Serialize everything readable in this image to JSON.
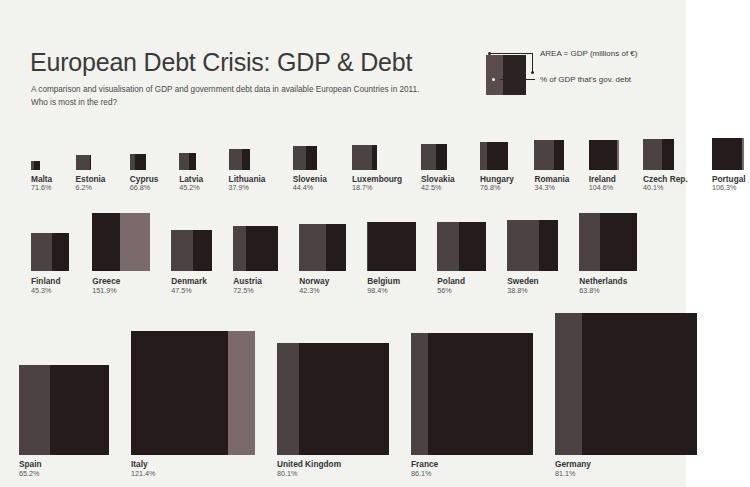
{
  "header": {
    "title": "European Debt Crisis: GDP & Debt",
    "subtitle_line1": "A comparison and visualisation of GDP and government debt data in available European Countries in 2011.",
    "subtitle_line2": "Who is most in the red?"
  },
  "legend": {
    "area_label": "AREA =  GDP (millions of €)",
    "debt_label": "% of GDP that's gov. debt"
  },
  "colors": {
    "background": "#f2f2ef",
    "gdp": "#4b4243",
    "debt": "#231b1c",
    "overflow": "#7b6a6b",
    "title": "#3a3a3a",
    "label": "#333333",
    "percent": "#555555"
  },
  "chart_data": {
    "type": "treemap",
    "title": "European Debt Crisis: GDP & Debt",
    "subtitle": "A comparison and visualisation of GDP and government debt data in available European Countries in 2011. Who is most in the red?",
    "area_meaning": "AREA =  GDP (millions of €)",
    "fill_meaning": "% of GDP that's gov. debt",
    "year": 2011,
    "value_unit": "% of GDP that is government debt",
    "rows": [
      {
        "row_index": 1,
        "countries": [
          {
            "name": "Malta",
            "percent_label": "71.6%",
            "percent": 71.6,
            "size": 9
          },
          {
            "name": "Estonia",
            "percent_label": "6.2%",
            "percent": 6.2,
            "size": 15
          },
          {
            "name": "Cyprus",
            "percent_label": "66.8%",
            "percent": 66.8,
            "size": 16
          },
          {
            "name": "Latvia",
            "percent_label": "45.2%",
            "percent": 45.2,
            "size": 17
          },
          {
            "name": "Lithuania",
            "percent_label": "37.9%",
            "percent": 37.9,
            "size": 21
          },
          {
            "name": "Slovenia",
            "percent_label": "44.4%",
            "percent": 44.4,
            "size": 24
          },
          {
            "name": "Luxembourg",
            "percent_label": "18.7%",
            "percent": 18.7,
            "size": 25
          },
          {
            "name": "Slovakia",
            "percent_label": "42.5%",
            "percent": 42.5,
            "size": 26
          },
          {
            "name": "Hungary",
            "percent_label": "76.8%",
            "percent": 76.8,
            "size": 28
          },
          {
            "name": "Romania",
            "percent_label": "34.3%",
            "percent": 34.3,
            "size": 30
          },
          {
            "name": "Ireland",
            "percent_label": "104.6%",
            "percent": 104.6,
            "size": 30
          },
          {
            "name": "Czech Rep.",
            "percent_label": "40.1%",
            "percent": 40.1,
            "size": 31
          },
          {
            "name": "Portugal",
            "percent_label": "106.3%",
            "percent": 106.3,
            "size": 32
          }
        ]
      },
      {
        "row_index": 2,
        "countries": [
          {
            "name": "Finland",
            "percent_label": "45.3%",
            "percent": 45.3,
            "size": 38
          },
          {
            "name": "Greece",
            "percent_label": "151.9%",
            "percent": 151.9,
            "size": 58
          },
          {
            "name": "Denmark",
            "percent_label": "47.5%",
            "percent": 47.5,
            "size": 41
          },
          {
            "name": "Austria",
            "percent_label": "72.5%",
            "percent": 72.5,
            "size": 45
          },
          {
            "name": "Norway",
            "percent_label": "42.3%",
            "percent": 42.3,
            "size": 47
          },
          {
            "name": "Belgium",
            "percent_label": "98.4%",
            "percent": 98.4,
            "size": 49
          },
          {
            "name": "Poland",
            "percent_label": "56%",
            "percent": 56.0,
            "size": 49
          },
          {
            "name": "Sweden",
            "percent_label": "38.8%",
            "percent": 38.8,
            "size": 51
          },
          {
            "name": "Netherlands",
            "percent_label": "63.8%",
            "percent": 63.8,
            "size": 58
          }
        ]
      },
      {
        "row_index": 3,
        "countries": [
          {
            "name": "Spain",
            "percent_label": "65.2%",
            "percent": 65.2,
            "size": 90
          },
          {
            "name": "Italy",
            "percent_label": "121.4%",
            "percent": 121.4,
            "size": 124
          },
          {
            "name": "United Kingdom",
            "percent_label": "80.1%",
            "percent": 80.1,
            "size": 112
          },
          {
            "name": "France",
            "percent_label": "86.1%",
            "percent": 86.1,
            "size": 122
          },
          {
            "name": "Germany",
            "percent_label": "81.1%",
            "percent": 81.1,
            "size": 142
          }
        ]
      }
    ]
  }
}
